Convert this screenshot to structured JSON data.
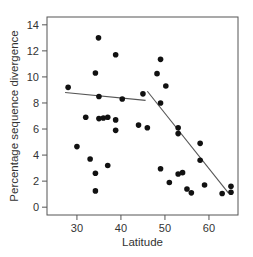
{
  "chart_data": {
    "type": "scatter",
    "title": "",
    "xlabel": "Latitude",
    "ylabel": "Percentage sequence divergence",
    "xlim": [
      23.2,
      66.6
    ],
    "ylim": [
      -0.6,
      14.6
    ],
    "xticks": [
      30,
      40,
      50,
      60
    ],
    "yticks": [
      0,
      2,
      4,
      6,
      8,
      10,
      12,
      14
    ],
    "grid": false,
    "legend": null,
    "colors": {
      "points": "#111111",
      "lines": "#555555",
      "axes": "#555555"
    },
    "points": [
      {
        "x": 28.0,
        "y": 9.2
      },
      {
        "x": 30.0,
        "y": 4.65
      },
      {
        "x": 32.0,
        "y": 6.9
      },
      {
        "x": 33.0,
        "y": 3.7
      },
      {
        "x": 34.2,
        "y": 10.3
      },
      {
        "x": 34.2,
        "y": 2.6
      },
      {
        "x": 34.2,
        "y": 1.25
      },
      {
        "x": 34.9,
        "y": 13.0
      },
      {
        "x": 35.0,
        "y": 8.5
      },
      {
        "x": 35.0,
        "y": 6.8
      },
      {
        "x": 36.0,
        "y": 6.85
      },
      {
        "x": 37.0,
        "y": 6.9
      },
      {
        "x": 37.0,
        "y": 3.2
      },
      {
        "x": 38.8,
        "y": 11.7
      },
      {
        "x": 38.8,
        "y": 6.7
      },
      {
        "x": 38.8,
        "y": 5.9
      },
      {
        "x": 40.3,
        "y": 8.3
      },
      {
        "x": 44.0,
        "y": 6.3
      },
      {
        "x": 45.0,
        "y": 8.7
      },
      {
        "x": 46.0,
        "y": 6.1
      },
      {
        "x": 48.2,
        "y": 10.25
      },
      {
        "x": 49.0,
        "y": 11.35
      },
      {
        "x": 49.0,
        "y": 8.0
      },
      {
        "x": 49.0,
        "y": 2.95
      },
      {
        "x": 50.2,
        "y": 9.3
      },
      {
        "x": 51.0,
        "y": 1.9
      },
      {
        "x": 53.0,
        "y": 6.1
      },
      {
        "x": 53.0,
        "y": 5.65
      },
      {
        "x": 53.0,
        "y": 2.55
      },
      {
        "x": 54.0,
        "y": 2.65
      },
      {
        "x": 55.0,
        "y": 1.4
      },
      {
        "x": 56.0,
        "y": 1.1
      },
      {
        "x": 58.0,
        "y": 4.9
      },
      {
        "x": 58.0,
        "y": 3.6
      },
      {
        "x": 59.0,
        "y": 1.7
      },
      {
        "x": 63.0,
        "y": 1.05
      },
      {
        "x": 65.0,
        "y": 1.6
      },
      {
        "x": 65.0,
        "y": 1.15
      }
    ],
    "fit_lines": [
      {
        "name": "segment-south",
        "x": [
          27.3,
          45.6
        ],
        "y": [
          8.8,
          8.2
        ]
      },
      {
        "name": "segment-north",
        "x": [
          46.0,
          64.4
        ],
        "y": [
          8.9,
          1.1
        ]
      }
    ]
  }
}
